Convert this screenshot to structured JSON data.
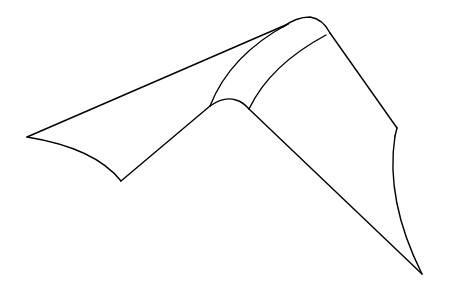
{
  "figure": {
    "type": "line-drawing",
    "background": "#ffffff",
    "stroke_color": "#000000",
    "labels": []
  }
}
